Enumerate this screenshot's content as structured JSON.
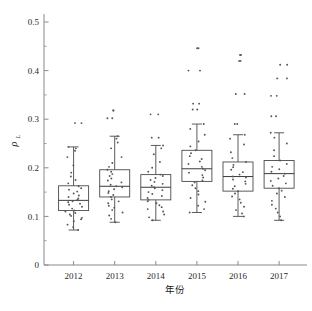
{
  "chart_data": {
    "type": "box",
    "title": "",
    "xlabel": "年份",
    "ylabel": "ρL",
    "ylabel_symbol": "ρ",
    "ylabel_subscript": "L",
    "categories": [
      "2012",
      "2013",
      "2014",
      "2015",
      "2016",
      "2017"
    ],
    "ylim": [
      0,
      0.5
    ],
    "y_major_ticks": [
      0,
      0.1,
      0.2,
      0.3,
      0.4,
      0.5
    ],
    "y_major_tick_labels": [
      "0",
      "0.1",
      "0.2",
      "0.3",
      "0.4",
      "0.5"
    ],
    "y_minor_ticks": [
      0.05,
      0.15,
      0.25,
      0.35,
      0.45
    ],
    "grid": false,
    "legend": "none",
    "boxes": [
      {
        "category": "2012",
        "whisker_low": 0.072,
        "q1": 0.112,
        "median": 0.133,
        "q3": 0.163,
        "whisker_high": 0.243,
        "outliers": [
          0.292
        ],
        "points": [
          0.072,
          0.078,
          0.083,
          0.09,
          0.094,
          0.097,
          0.101,
          0.104,
          0.107,
          0.11,
          0.112,
          0.116,
          0.12,
          0.124,
          0.126,
          0.129,
          0.131,
          0.133,
          0.134,
          0.137,
          0.14,
          0.143,
          0.147,
          0.151,
          0.155,
          0.158,
          0.162,
          0.168,
          0.175,
          0.182,
          0.19,
          0.205,
          0.222,
          0.235,
          0.24,
          0.243,
          0.292
        ]
      },
      {
        "category": "2013",
        "whisker_low": 0.088,
        "q1": 0.14,
        "median": 0.162,
        "q3": 0.196,
        "whisker_high": 0.265,
        "outliers": [
          0.302,
          0.318
        ],
        "points": [
          0.088,
          0.095,
          0.102,
          0.108,
          0.113,
          0.118,
          0.122,
          0.127,
          0.131,
          0.135,
          0.14,
          0.144,
          0.148,
          0.152,
          0.156,
          0.16,
          0.162,
          0.165,
          0.17,
          0.174,
          0.178,
          0.183,
          0.187,
          0.192,
          0.196,
          0.202,
          0.21,
          0.222,
          0.24,
          0.252,
          0.26,
          0.265,
          0.302,
          0.318
        ]
      },
      {
        "category": "2014",
        "whisker_low": 0.092,
        "q1": 0.134,
        "median": 0.16,
        "q3": 0.186,
        "whisker_high": 0.246,
        "outliers": [
          0.262,
          0.31
        ],
        "points": [
          0.092,
          0.098,
          0.104,
          0.11,
          0.115,
          0.119,
          0.123,
          0.127,
          0.131,
          0.134,
          0.138,
          0.142,
          0.146,
          0.15,
          0.154,
          0.158,
          0.16,
          0.163,
          0.167,
          0.171,
          0.175,
          0.179,
          0.183,
          0.186,
          0.192,
          0.2,
          0.212,
          0.228,
          0.24,
          0.246,
          0.262,
          0.31
        ]
      },
      {
        "category": "2015",
        "whisker_low": 0.108,
        "q1": 0.172,
        "median": 0.198,
        "q3": 0.236,
        "whisker_high": 0.29,
        "outliers": [
          0.32,
          0.332,
          0.4,
          0.446
        ],
        "points": [
          0.108,
          0.115,
          0.122,
          0.13,
          0.138,
          0.145,
          0.152,
          0.158,
          0.164,
          0.17,
          0.174,
          0.18,
          0.185,
          0.19,
          0.195,
          0.198,
          0.202,
          0.208,
          0.213,
          0.218,
          0.224,
          0.23,
          0.236,
          0.244,
          0.254,
          0.268,
          0.28,
          0.29,
          0.32,
          0.332,
          0.4,
          0.446
        ]
      },
      {
        "category": "2016",
        "whisker_low": 0.1,
        "q1": 0.152,
        "median": 0.182,
        "q3": 0.212,
        "whisker_high": 0.268,
        "outliers": [
          0.29,
          0.352,
          0.42,
          0.432
        ],
        "points": [
          0.1,
          0.106,
          0.113,
          0.12,
          0.128,
          0.135,
          0.141,
          0.147,
          0.152,
          0.157,
          0.162,
          0.167,
          0.172,
          0.176,
          0.18,
          0.182,
          0.186,
          0.191,
          0.196,
          0.201,
          0.206,
          0.212,
          0.22,
          0.232,
          0.248,
          0.26,
          0.268,
          0.29,
          0.352,
          0.42,
          0.432
        ]
      },
      {
        "category": "2017",
        "whisker_low": 0.092,
        "q1": 0.158,
        "median": 0.188,
        "q3": 0.215,
        "whisker_high": 0.272,
        "outliers": [
          0.306,
          0.348,
          0.384,
          0.412
        ],
        "points": [
          0.092,
          0.1,
          0.108,
          0.116,
          0.124,
          0.132,
          0.14,
          0.147,
          0.153,
          0.158,
          0.163,
          0.168,
          0.173,
          0.178,
          0.183,
          0.188,
          0.192,
          0.197,
          0.202,
          0.208,
          0.215,
          0.224,
          0.236,
          0.25,
          0.262,
          0.272,
          0.306,
          0.348,
          0.384,
          0.412
        ]
      }
    ],
    "colors": {
      "axis": "#8a8a8a",
      "box": "#4a4a4a",
      "median": "#3a3a3a",
      "point": "#555555",
      "background": "#ffffff"
    }
  }
}
